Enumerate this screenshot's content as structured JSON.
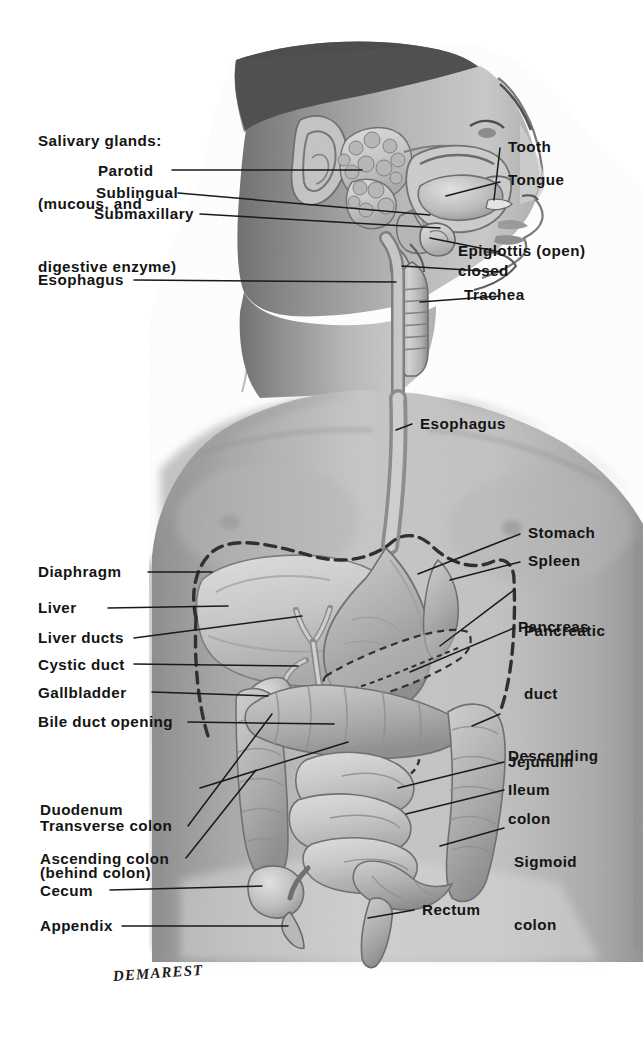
{
  "figure": {
    "credit": "DEMAREST",
    "background_color": "#ffffff",
    "ink_color": "#141414",
    "body_tone": "#b9b9b9"
  },
  "labels": {
    "salivary_heading": {
      "line1": "Salivary glands:",
      "line2": "(mucous, and",
      "line3": "digestive enzyme)"
    },
    "parotid": "Parotid",
    "sublingual": "Sublingual",
    "submaxillary": "Submaxillary",
    "esophagus_neck": "Esophagus",
    "esophagus_chest": "Esophagus",
    "tooth": "Tooth",
    "tongue": "Tongue",
    "epiglottis_open": "Epiglottis (open)",
    "epiglottis_closed": "closed",
    "trachea": "Trachea",
    "stomach": "Stomach",
    "spleen": "Spleen",
    "pancreatic_duct_l1": "Pancreatic",
    "pancreatic_duct_l2": "duct",
    "pancreas": "Pancreas",
    "diaphragm": "Diaphragm",
    "liver": "Liver",
    "liver_ducts": "Liver ducts",
    "cystic_duct": "Cystic duct",
    "gallbladder": "Gallbladder",
    "bile_duct_opening": "Bile duct opening",
    "duodenum_l1": "Duodenum",
    "duodenum_l2": "(behind colon)",
    "transverse_colon": "Transverse colon",
    "ascending_colon": "Ascending colon",
    "cecum": "Cecum",
    "appendix": "Appendix",
    "descending_colon_l1": "Descending",
    "descending_colon_l2": "colon",
    "jejunum": "Jejunum",
    "ileum": "Ileum",
    "sigmoid_colon_l1": "Sigmoid",
    "sigmoid_colon_l2": "colon",
    "rectum": "Rectum"
  }
}
